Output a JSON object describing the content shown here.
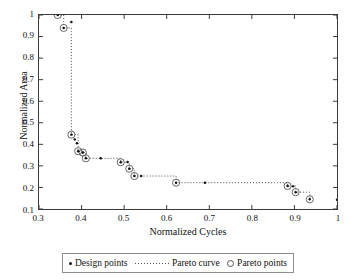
{
  "chart_data": {
    "type": "scatter",
    "title": "",
    "xlabel": "Normalized Cycles",
    "ylabel": "Normalized Area",
    "xlim": [
      0.3,
      1.0
    ],
    "ylim": [
      0.1,
      1.0
    ],
    "xticks": [
      "0.3",
      "0.4",
      "0.5",
      "0.6",
      "0.7",
      "0.8",
      "0.9",
      "1"
    ],
    "xtick_values": [
      0.3,
      0.4,
      0.5,
      0.6,
      0.7,
      0.8,
      0.9,
      1.0
    ],
    "yticks": [
      "0.1",
      "0.2",
      "0.3",
      "0.4",
      "0.5",
      "0.6",
      "0.7",
      "0.8",
      "0.9",
      "1"
    ],
    "ytick_values": [
      0.1,
      0.2,
      0.3,
      0.4,
      0.5,
      0.6,
      0.7,
      0.8,
      0.9,
      1.0
    ],
    "grid": false,
    "legend_position": "bottom-outside",
    "series": [
      {
        "name": "Design points",
        "marker": "filled-dot",
        "points": [
          [
            0.344,
            1.0
          ],
          [
            0.358,
            0.94
          ],
          [
            0.376,
            0.968
          ],
          [
            0.376,
            0.445
          ],
          [
            0.384,
            0.423
          ],
          [
            0.389,
            0.405
          ],
          [
            0.392,
            0.368
          ],
          [
            0.403,
            0.362
          ],
          [
            0.41,
            0.335
          ],
          [
            0.445,
            0.335
          ],
          [
            0.492,
            0.317
          ],
          [
            0.508,
            0.318
          ],
          [
            0.512,
            0.287
          ],
          [
            0.524,
            0.253
          ],
          [
            0.54,
            0.253
          ],
          [
            0.622,
            0.222
          ],
          [
            0.69,
            0.222
          ],
          [
            0.884,
            0.207
          ],
          [
            0.897,
            0.205
          ],
          [
            0.903,
            0.178
          ],
          [
            0.936,
            0.145
          ],
          [
            1.0,
            0.143
          ]
        ]
      },
      {
        "name": "Pareto points",
        "marker": "open-circle",
        "points": [
          [
            0.344,
            1.0
          ],
          [
            0.358,
            0.94
          ],
          [
            0.376,
            0.445
          ],
          [
            0.392,
            0.368
          ],
          [
            0.403,
            0.362
          ],
          [
            0.41,
            0.335
          ],
          [
            0.492,
            0.317
          ],
          [
            0.512,
            0.287
          ],
          [
            0.524,
            0.253
          ],
          [
            0.622,
            0.222
          ],
          [
            0.884,
            0.207
          ],
          [
            0.903,
            0.178
          ],
          [
            0.936,
            0.145
          ]
        ]
      },
      {
        "name": "Pareto curve",
        "marker": "dotted-line",
        "path": [
          [
            0.344,
            1.0
          ],
          [
            0.358,
            1.0
          ],
          [
            0.358,
            0.94
          ],
          [
            0.376,
            0.94
          ],
          [
            0.376,
            0.445
          ],
          [
            0.392,
            0.445
          ],
          [
            0.392,
            0.368
          ],
          [
            0.403,
            0.368
          ],
          [
            0.403,
            0.362
          ],
          [
            0.41,
            0.362
          ],
          [
            0.41,
            0.335
          ],
          [
            0.492,
            0.335
          ],
          [
            0.492,
            0.317
          ],
          [
            0.512,
            0.317
          ],
          [
            0.512,
            0.287
          ],
          [
            0.524,
            0.287
          ],
          [
            0.524,
            0.253
          ],
          [
            0.622,
            0.253
          ],
          [
            0.622,
            0.222
          ],
          [
            0.884,
            0.222
          ],
          [
            0.884,
            0.207
          ],
          [
            0.903,
            0.207
          ],
          [
            0.903,
            0.178
          ],
          [
            0.936,
            0.178
          ],
          [
            0.936,
            0.145
          ]
        ]
      }
    ],
    "colors": {
      "marker": "#111111",
      "curve": "#555555",
      "frame": "#3a3a3a",
      "background": "#ffffff"
    }
  },
  "legend": {
    "entries": [
      {
        "label": "Design points",
        "marker": "filled-dot"
      },
      {
        "label": "Pareto curve",
        "marker": "dotted-line"
      },
      {
        "label": "Pareto points",
        "marker": "open-circle"
      }
    ]
  }
}
